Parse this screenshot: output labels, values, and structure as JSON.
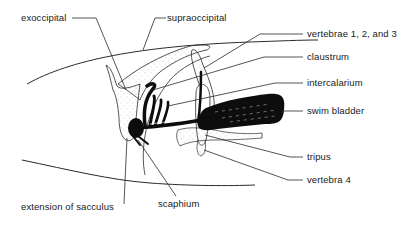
{
  "diagram": {
    "labels": {
      "exoccipital": "exoccipital",
      "supraoccipital": "supraoccipital",
      "vertebrae_123": "vertebrae 1, 2, and 3",
      "claustrum": "claustrum",
      "intercalarium": "intercalarium",
      "swim_bladder": "swim bladder",
      "tripus": "tripus",
      "vertebra_4": "vertebra 4",
      "extension_of_sacculus": "extension of sacculus",
      "scaphium": "scaphium"
    },
    "colors": {
      "line": "#2a2a2a",
      "fill_dark": "#0d0d0d",
      "stipple": "#9a9a9a",
      "background": "#ffffff"
    }
  }
}
